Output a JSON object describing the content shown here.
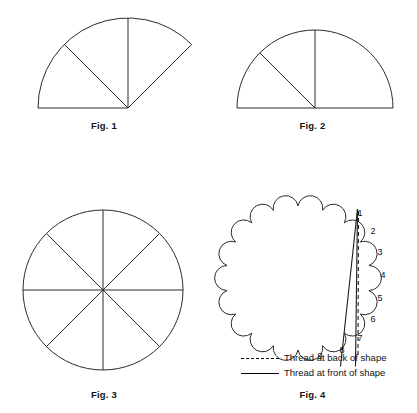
{
  "document": {
    "type": "instructional-diagram",
    "subject": "Folding a circle into sectors and stitching a scalloped shape",
    "background_color": "#ffffff",
    "line_color": "#000000"
  },
  "figures": [
    {
      "id": "fig1",
      "caption": "Fig. 1",
      "shape": "sector",
      "description": "Quarter-plus sector (approximately 135 degrees) with apex at lower right, divided into three equal wedges by two internal radius lines",
      "sweep_degrees": 135,
      "divisions": 3,
      "apex": {
        "x": 128,
        "y": 108
      },
      "radius": 90
    },
    {
      "id": "fig2",
      "caption": "Fig. 2",
      "shape": "semicircle",
      "description": "Half circle with centre at bottom middle, divided by a vertical radius and one diagonal radius",
      "sweep_degrees": 180,
      "divisions": 4,
      "centre": {
        "x": 107,
        "y": 108
      },
      "radius": 78
    },
    {
      "id": "fig3",
      "caption": "Fig. 3",
      "shape": "circle",
      "description": "Full circle divided into eight equal sectors by four diameters",
      "sweep_degrees": 360,
      "divisions": 8,
      "centre": {
        "x": 103,
        "y": 120
      },
      "radius": 80
    },
    {
      "id": "fig4",
      "caption": "Fig. 4",
      "shape": "scalloped-circle",
      "description": "Scalloped circular shape with numbered scallops showing the stitching order, with thread shown passing in front of and behind the shape",
      "scallop_count": 18,
      "centre": {
        "x": 90,
        "y": 108
      },
      "radius": 72,
      "numbered_scallops": [
        "1",
        "2",
        "3",
        "4",
        "5",
        "6",
        "7",
        "8",
        "9"
      ]
    }
  ],
  "legend": {
    "items": [
      {
        "style": "dashed",
        "label": "Thread at back of shape"
      },
      {
        "style": "solid",
        "label": "Thread at front of shape"
      }
    ]
  }
}
